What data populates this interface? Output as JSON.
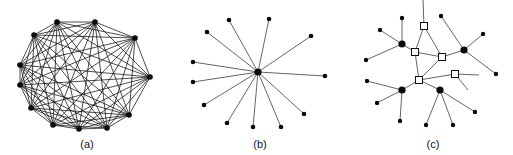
{
  "figure": {
    "panels": [
      {
        "id": "a",
        "label": "(a)",
        "type": "complete-graph",
        "description": "Fully connected mesh: every node linked to every other node",
        "label_pos": [
          87,
          148
        ],
        "nodes": [
          [
            57,
            22
          ],
          [
            95,
            22
          ],
          [
            135,
            38
          ],
          [
            150,
            77
          ],
          [
            129,
            115
          ],
          [
            107,
            128
          ],
          [
            79,
            129
          ],
          [
            53,
            125
          ],
          [
            31,
            108
          ],
          [
            20,
            85
          ],
          [
            20,
            65
          ],
          [
            34,
            35
          ]
        ]
      },
      {
        "id": "b",
        "label": "(b)",
        "type": "star",
        "description": "Star topology: one central hub connected to each leaf",
        "label_pos": [
          260,
          148
        ],
        "center": [
          258,
          72
        ],
        "leaves": [
          [
            229,
            20
          ],
          [
            269,
            19
          ],
          [
            311,
            36
          ],
          [
            325,
            76
          ],
          [
            304,
            114
          ],
          [
            281,
            127
          ],
          [
            253,
            127
          ],
          [
            227,
            123
          ],
          [
            204,
            105
          ],
          [
            193,
            82
          ],
          [
            193,
            62
          ],
          [
            207,
            32
          ]
        ]
      },
      {
        "id": "c",
        "label": "(c)",
        "type": "hierarchical",
        "description": "Hierarchical network: routers (squares) interconnect hubs (large dots), each hub serving leaf nodes",
        "label_pos": [
          433,
          148
        ],
        "routers": [
          {
            "id": "S1",
            "pos": [
              424,
              26
            ]
          },
          {
            "id": "S2",
            "pos": [
              415,
              52
            ]
          },
          {
            "id": "S3",
            "pos": [
              442,
              57
            ]
          },
          {
            "id": "S4",
            "pos": [
              455,
              74
            ]
          },
          {
            "id": "S5",
            "pos": [
              419,
              80
            ]
          }
        ],
        "hubs": [
          {
            "id": "H1",
            "pos": [
              402,
              44
            ],
            "leaves": [
              [
                402,
                18
              ],
              [
                380,
                30
              ],
              [
                366,
                60
              ]
            ]
          },
          {
            "id": "H2",
            "pos": [
              464,
              50
            ],
            "leaves": [
              [
                441,
                16
              ],
              [
                483,
                34
              ],
              [
                496,
                74
              ]
            ]
          },
          {
            "id": "H3",
            "pos": [
              402,
              90
            ],
            "leaves": [
              [
                367,
                81
              ],
              [
                377,
                103
              ],
              [
                400,
                121
              ]
            ]
          },
          {
            "id": "H4",
            "pos": [
              440,
              90
            ],
            "leaves": [
              [
                426,
                125
              ],
              [
                453,
                125
              ],
              [
                475,
                112
              ]
            ]
          }
        ],
        "edges": [
          [
            "S1",
            "S2"
          ],
          [
            "S1",
            "S3"
          ],
          [
            "S2",
            "S3"
          ],
          [
            "S2",
            "S5"
          ],
          [
            "S3",
            "S5"
          ],
          [
            "S5",
            "S4"
          ],
          [
            "S3",
            "H2"
          ],
          [
            "S2",
            "H1"
          ],
          [
            "S5",
            "H3"
          ],
          [
            "S5",
            "H4"
          ]
        ],
        "stubs": [
          {
            "from": "S1",
            "to": [
              423,
              0
            ]
          },
          {
            "from": "S4",
            "to": [
              479,
              75
            ]
          },
          {
            "from": "S4",
            "to": [
              468,
              90
            ]
          }
        ]
      }
    ]
  },
  "colors": {
    "background": "#ffffff",
    "ink": "#111111",
    "router_fill": "#ffffff"
  }
}
